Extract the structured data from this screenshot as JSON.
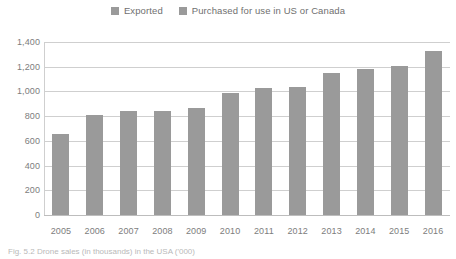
{
  "legend": {
    "position": "top-center",
    "swatch_color": "#9a9a9a",
    "entries": [
      {
        "label": "Exported",
        "icon": "square-swatch-icon"
      },
      {
        "label": "Purchased for use in US or Canada",
        "icon": "square-swatch-icon"
      }
    ]
  },
  "caption": {
    "prefix": "Fig. 5.2",
    "text": "Fig. 5.2  Drone sales (in thousands) in the USA ('000)"
  },
  "chart_data": {
    "type": "bar",
    "title": "",
    "subtitle": "",
    "xlabel": "",
    "ylabel": "",
    "categories": [
      "2005",
      "2006",
      "2007",
      "2008",
      "2009",
      "2010",
      "2011",
      "2012",
      "2013",
      "2014",
      "2015",
      "2016"
    ],
    "values": [
      655,
      810,
      845,
      845,
      870,
      985,
      1025,
      1035,
      1150,
      1180,
      1205,
      1330
    ],
    "series": [
      {
        "name": "Purchased for use in US or Canada",
        "values": [
          655,
          810,
          845,
          845,
          870,
          985,
          1025,
          1035,
          1150,
          1180,
          1205,
          1330
        ],
        "color": "#9a9a9a"
      }
    ],
    "ylim": [
      0,
      1400
    ],
    "ytick_step": 200,
    "ytick_labels": [
      "1,400",
      "1,200",
      "1,000",
      "800",
      "600",
      "400",
      "200",
      "0"
    ],
    "ytick_values": [
      1400,
      1200,
      1000,
      800,
      600,
      400,
      200,
      0
    ],
    "grid": true,
    "grid_color": "#cfcfcf",
    "legend_position": "top-center",
    "bar_color": "#9a9a9a"
  }
}
